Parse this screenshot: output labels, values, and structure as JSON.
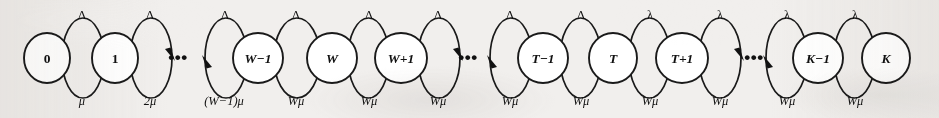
{
  "figure": {
    "name": "state-transition-diagram",
    "kind": "markov-chain-birth-death-process",
    "background_color": "#f1efed",
    "ink_color": "#111111",
    "node_fill": "#ffffff",
    "width": 939,
    "height": 118
  },
  "states": [
    {
      "id": "s0",
      "label": "0",
      "cx": 47,
      "cy": 58,
      "rx": 23,
      "ry": 25,
      "italic": false
    },
    {
      "id": "s1",
      "label": "1",
      "cx": 115,
      "cy": 58,
      "rx": 23,
      "ry": 25,
      "italic": false
    },
    {
      "id": "sWm1",
      "label": "W−1",
      "cx": 258,
      "cy": 58,
      "rx": 25,
      "ry": 25,
      "italic": true
    },
    {
      "id": "sW",
      "label": "W",
      "cx": 332,
      "cy": 58,
      "rx": 25,
      "ry": 25,
      "italic": true
    },
    {
      "id": "sWp1",
      "label": "W+1",
      "cx": 401,
      "cy": 58,
      "rx": 26,
      "ry": 25,
      "italic": true
    },
    {
      "id": "sTm1",
      "label": "T−1",
      "cx": 543,
      "cy": 58,
      "rx": 25,
      "ry": 25,
      "italic": true
    },
    {
      "id": "sT",
      "label": "T",
      "cx": 613,
      "cy": 58,
      "rx": 24,
      "ry": 25,
      "italic": true
    },
    {
      "id": "sTp1",
      "label": "T+1",
      "cx": 682,
      "cy": 58,
      "rx": 26,
      "ry": 25,
      "italic": true
    },
    {
      "id": "sKm1",
      "label": "K−1",
      "cx": 818,
      "cy": 58,
      "rx": 25,
      "ry": 25,
      "italic": true
    },
    {
      "id": "sK",
      "label": "K",
      "cx": 886,
      "cy": 58,
      "rx": 24,
      "ry": 25,
      "italic": true
    }
  ],
  "ellipses": [
    {
      "id": "gap1",
      "label": "•••",
      "cx": 178,
      "cy": 57
    },
    {
      "id": "gap2",
      "label": "•••",
      "cx": 468,
      "cy": 57
    },
    {
      "id": "gap3",
      "label": "•••",
      "cx": 754,
      "cy": 57
    }
  ],
  "arrival_transitions": [
    {
      "id": "a0",
      "label": "Λ",
      "from": "0",
      "to": "1",
      "x1": 62,
      "x2": 104,
      "label_x": 82,
      "label_y": 15
    },
    {
      "id": "a1",
      "label": "Λ",
      "from": "1",
      "to": "…",
      "x1": 130,
      "x2": 172,
      "label_x": 150,
      "label_y": 15
    },
    {
      "id": "a2",
      "label": "Λ",
      "from": "…",
      "to": "W−1",
      "x1": 205,
      "x2": 247,
      "label_x": 225,
      "label_y": 15
    },
    {
      "id": "a3",
      "label": "Λ",
      "from": "W−1",
      "to": "W",
      "x1": 274,
      "x2": 320,
      "label_x": 296,
      "label_y": 15
    },
    {
      "id": "a4",
      "label": "Λ",
      "from": "W",
      "to": "W+1",
      "x1": 348,
      "x2": 389,
      "label_x": 369,
      "label_y": 15
    },
    {
      "id": "a5",
      "label": "Λ",
      "from": "W+1",
      "to": "…",
      "x1": 418,
      "x2": 460,
      "label_x": 438,
      "label_y": 15
    },
    {
      "id": "a6",
      "label": "Λ",
      "from": "…",
      "to": "T−1",
      "x1": 490,
      "x2": 532,
      "label_x": 510,
      "label_y": 15
    },
    {
      "id": "a7",
      "label": "Λ",
      "from": "T−1",
      "to": "T",
      "x1": 560,
      "x2": 601,
      "label_x": 581,
      "label_y": 15
    },
    {
      "id": "a8",
      "label": "λ",
      "from": "T",
      "to": "T+1",
      "x1": 629,
      "x2": 670,
      "label_x": 650,
      "label_y": 15
    },
    {
      "id": "a9",
      "label": "λ",
      "from": "T+1",
      "to": "…",
      "x1": 699,
      "x2": 741,
      "label_x": 720,
      "label_y": 15
    },
    {
      "id": "a10",
      "label": "λ",
      "from": "…",
      "to": "K−1",
      "x1": 766,
      "x2": 807,
      "label_x": 787,
      "label_y": 15
    },
    {
      "id": "a11",
      "label": "λ",
      "from": "K−1",
      "to": "K",
      "x1": 834,
      "x2": 875,
      "label_x": 855,
      "label_y": 15
    }
  ],
  "service_transitions": [
    {
      "id": "m0",
      "label": "μ",
      "from": "1",
      "to": "0",
      "x1": 104,
      "x2": 62,
      "label_x": 82,
      "label_y": 101
    },
    {
      "id": "m1",
      "label": "2μ",
      "from": "…",
      "to": "1",
      "x1": 172,
      "x2": 130,
      "label_x": 150,
      "label_y": 101
    },
    {
      "id": "m2",
      "label": "(W−1)μ",
      "from": "W−1",
      "to": "…",
      "x1": 247,
      "x2": 205,
      "label_x": 224,
      "label_y": 101
    },
    {
      "id": "m3",
      "label": "Wμ",
      "from": "W",
      "to": "W−1",
      "x1": 320,
      "x2": 274,
      "label_x": 296,
      "label_y": 101
    },
    {
      "id": "m4",
      "label": "Wμ",
      "from": "W+1",
      "to": "W",
      "x1": 389,
      "x2": 348,
      "label_x": 369,
      "label_y": 101
    },
    {
      "id": "m5",
      "label": "Wμ",
      "from": "…",
      "to": "W+1",
      "x1": 460,
      "x2": 418,
      "label_x": 438,
      "label_y": 101
    },
    {
      "id": "m6",
      "label": "Wμ",
      "from": "T−1",
      "to": "…",
      "x1": 532,
      "x2": 490,
      "label_x": 510,
      "label_y": 101
    },
    {
      "id": "m7",
      "label": "Wμ",
      "from": "T",
      "to": "T−1",
      "x1": 601,
      "x2": 560,
      "label_x": 581,
      "label_y": 101
    },
    {
      "id": "m8",
      "label": "Wμ",
      "from": "T+1",
      "to": "T",
      "x1": 670,
      "x2": 629,
      "label_x": 650,
      "label_y": 101
    },
    {
      "id": "m9",
      "label": "Wμ",
      "from": "…",
      "to": "T+1",
      "x1": 741,
      "x2": 699,
      "label_x": 720,
      "label_y": 101
    },
    {
      "id": "m10",
      "label": "Wμ",
      "from": "K−1",
      "to": "…",
      "x1": 807,
      "x2": 766,
      "label_x": 787,
      "label_y": 101
    },
    {
      "id": "m11",
      "label": "Wμ",
      "from": "K",
      "to": "K−1",
      "x1": 875,
      "x2": 834,
      "label_x": 855,
      "label_y": 101
    }
  ]
}
